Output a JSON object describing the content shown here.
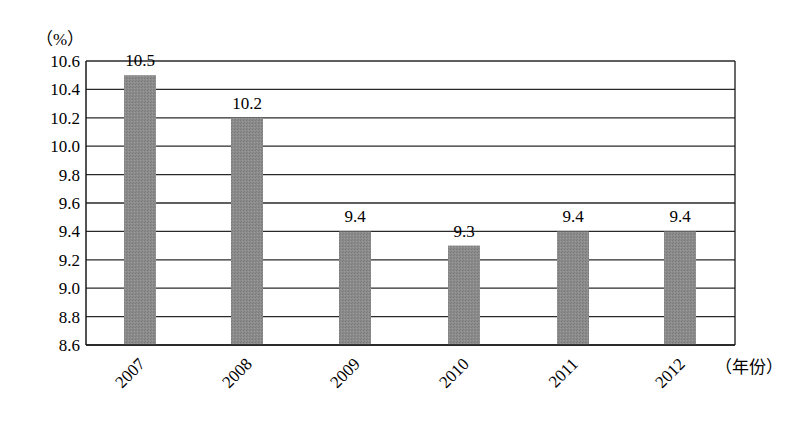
{
  "chart_data": {
    "type": "bar",
    "title": "",
    "xlabel": "（年份）",
    "ylabel": "（%）",
    "categories": [
      "2007",
      "2008",
      "2009",
      "2010",
      "2011",
      "2012"
    ],
    "values": [
      10.5,
      10.2,
      9.4,
      9.3,
      9.4,
      9.4
    ],
    "data_labels": [
      "10.5",
      "10.2",
      "9.4",
      "9.3",
      "9.4",
      "9.4"
    ],
    "ylim": [
      8.6,
      10.6
    ],
    "yticks": [
      "10.6",
      "10.4",
      "10.2",
      "10.0",
      "9.8",
      "9.6",
      "9.4",
      "9.2",
      "9.0",
      "8.8",
      "8.6"
    ],
    "grid": true,
    "legend": null,
    "bar_color": "#8a8a8a"
  }
}
